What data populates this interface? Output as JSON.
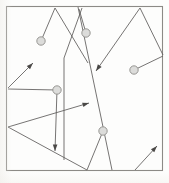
{
  "figure": {
    "kind": "line-drawing",
    "canvas": {
      "width": 169,
      "height": 183
    },
    "background_color": "#fdfdfc"
  },
  "frame": {
    "name": "border-frame",
    "x": 6.5,
    "y": 6.5,
    "width": 156,
    "height": 164,
    "stroke_color": "#8c8a86",
    "stroke_width": 1.1
  },
  "style": {
    "line_color": "#5d5b5a",
    "line_width": 0.85,
    "node_fill": "#dcdcda",
    "node_stroke": "#8f8d8a",
    "arrow_fill": "#4a4846"
  },
  "paths": [
    {
      "name": "path-zigzag-left-peak",
      "points": "41,41 55,8 88,63",
      "has_arrow": false
    },
    {
      "name": "path-long-descend-right",
      "points": "78,7 112,170",
      "has_arrow": false
    },
    {
      "name": "path-steep-left-fall",
      "points": "82,8 64,58 64,160",
      "has_arrow": false
    },
    {
      "name": "path-circle-to-peak-short",
      "points": "86,33 79,9",
      "has_arrow": false
    },
    {
      "name": "path-upper-right-vee",
      "points": "96,71 140,8 163,55",
      "has_arrow": true,
      "arrow_at": "96,71",
      "arrow_angle": 235
    },
    {
      "name": "path-right-node-link",
      "points": "134,70 163,56",
      "has_arrow": false
    },
    {
      "name": "path-left-fan-upper",
      "points": "8,88 33,63",
      "has_arrow": true,
      "arrow_at": "33,63",
      "arrow_angle": 315
    },
    {
      "name": "path-left-fan-to-node",
      "points": "8,89 57,90",
      "has_arrow": false
    },
    {
      "name": "path-node-descend-arrow",
      "points": "57,90 55,151",
      "has_arrow": true,
      "arrow_at": "55,151",
      "arrow_angle": 90
    },
    {
      "name": "path-lower-left-to-right-arrow",
      "points": "8,127 89,103",
      "has_arrow": true,
      "arrow_at": "89,103",
      "arrow_angle": 343
    },
    {
      "name": "path-lower-left-long-diagonal",
      "points": "8,127 87,170",
      "has_arrow": false
    },
    {
      "name": "path-bottom-vee-left",
      "points": "87,170 103,131",
      "has_arrow": false
    },
    {
      "name": "path-bottom-vee-right",
      "points": "135,170 157,146",
      "has_arrow": true,
      "arrow_at": "157,146",
      "arrow_angle": 315
    }
  ],
  "nodes": [
    {
      "name": "node-circle-upper-left",
      "cx": 41,
      "cy": 41,
      "r": 4.2
    },
    {
      "name": "node-circle-upper-mid",
      "cx": 86,
      "cy": 33,
      "r": 4.2
    },
    {
      "name": "node-circle-right",
      "cx": 134,
      "cy": 70,
      "r": 4.2
    },
    {
      "name": "node-circle-center-left",
      "cx": 57,
      "cy": 90,
      "r": 4.2
    },
    {
      "name": "node-circle-lower-center",
      "cx": 103,
      "cy": 131,
      "r": 4.2
    }
  ],
  "arrowheads": [
    {
      "name": "arrowhead-upper-left",
      "x": 33,
      "y": 63,
      "angle": -45
    },
    {
      "name": "arrowhead-mid-right",
      "x": 89,
      "y": 103,
      "angle": -17
    },
    {
      "name": "arrowhead-upper-right-down",
      "x": 96,
      "y": 71,
      "angle": 125
    },
    {
      "name": "arrowhead-lower-center-down",
      "x": 55,
      "y": 151,
      "angle": 91
    },
    {
      "name": "arrowhead-bottom-right",
      "x": 157,
      "y": 146,
      "angle": -47
    }
  ]
}
